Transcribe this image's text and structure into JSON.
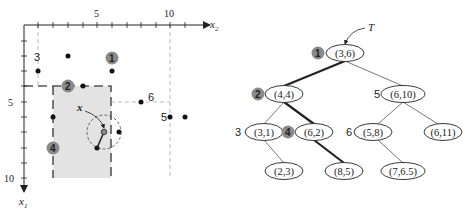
{
  "plot": {
    "x2_axis_label": "x",
    "x2_axis_sub": "2",
    "x1_axis_label": "x",
    "x1_axis_sub": "1",
    "x2_ticks": [
      "5",
      "10"
    ],
    "x1_ticks": [
      "5",
      "10"
    ],
    "query_label": "x",
    "point_labels": [
      "3",
      "6",
      "5"
    ],
    "badges": [
      "1",
      "2",
      "4"
    ]
  },
  "tree": {
    "root_pointer": "T",
    "nodes": [
      {
        "id": "n1",
        "label": "(3,6)",
        "order": "1",
        "badge": true
      },
      {
        "id": "n2",
        "label": "(4,4)",
        "order": "2",
        "badge": true
      },
      {
        "id": "n5",
        "label": "(6,10)",
        "order": "5",
        "badge": false
      },
      {
        "id": "n3",
        "label": "(3,1)",
        "order": "3",
        "badge": false
      },
      {
        "id": "n4",
        "label": "(6,2)",
        "order": "4",
        "badge": true
      },
      {
        "id": "n6",
        "label": "(5,8)",
        "order": "6",
        "badge": false
      },
      {
        "id": "n611",
        "label": "(6,11)",
        "order": "",
        "badge": false
      },
      {
        "id": "n23",
        "label": "(2,3)",
        "order": "",
        "badge": false
      },
      {
        "id": "n85",
        "label": "(8,5)",
        "order": "",
        "badge": false
      },
      {
        "id": "n765",
        "label": "(7,6.5)",
        "order": "",
        "badge": false
      }
    ]
  },
  "colors": {
    "region_fill": "#e3e3e3",
    "badge_fill": "#8a8a8a",
    "ink": "#222222",
    "dash": "#999999"
  }
}
